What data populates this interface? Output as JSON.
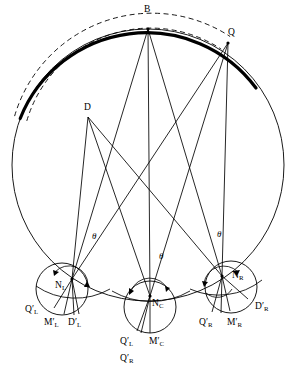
{
  "figure": {
    "title": "",
    "background": "#ffffff",
    "stroke_color": "#000000",
    "width": 292,
    "height": 375
  },
  "geometry": {
    "main_circle": {
      "cx": 148,
      "cy": 165,
      "r": 136
    },
    "bold_arc": {
      "cx": 148,
      "cy": 165,
      "r": 136,
      "start_deg": 200,
      "end_deg": 305
    },
    "dashed_arc_outer": {
      "cx": 148,
      "cy": 165,
      "r": 143,
      "start_deg": 200,
      "end_deg": 305
    },
    "dashed_arc_inner": {
      "cx": 148,
      "cy": 165,
      "r": 129,
      "start_deg": 200,
      "end_deg": 305
    },
    "node_circles": [
      {
        "name": "left",
        "cx": 62,
        "cy": 289,
        "r": 26
      },
      {
        "name": "center",
        "cx": 150,
        "cy": 307,
        "r": 26
      },
      {
        "name": "right",
        "cx": 231,
        "cy": 287,
        "r": 26
      }
    ],
    "node_points": [
      {
        "name": "N_L",
        "x": 72,
        "y": 279
      },
      {
        "name": "N_C",
        "x": 150,
        "y": 296
      },
      {
        "name": "N_R",
        "x": 222,
        "y": 276
      }
    ],
    "apex_points": [
      {
        "name": "B",
        "x": 148,
        "y": 29
      },
      {
        "name": "Q",
        "x": 228,
        "y": 43
      },
      {
        "name": "D",
        "x": 88,
        "y": 117
      }
    ]
  },
  "labels": {
    "apex": [
      {
        "id": "label-B",
        "text": "B",
        "sub": "",
        "prime": false,
        "x": 144,
        "y": 5
      },
      {
        "id": "label-Q",
        "text": "Q",
        "sub": "",
        "prime": false,
        "x": 228,
        "y": 28
      },
      {
        "id": "label-D",
        "text": "D",
        "sub": "",
        "prime": false,
        "x": 84,
        "y": 103
      }
    ],
    "nodes": [
      {
        "id": "label-NL",
        "text": "N",
        "sub": "L",
        "prime": false,
        "x": 55,
        "y": 281
      },
      {
        "id": "label-NC",
        "text": "N",
        "sub": "C",
        "prime": false,
        "x": 152,
        "y": 299
      },
      {
        "id": "label-NR",
        "text": "N",
        "sub": "R",
        "prime": false,
        "x": 232,
        "y": 271
      }
    ],
    "rays": [
      {
        "id": "label-QL-left",
        "text": "Q",
        "sub": "L",
        "prime": true,
        "x": 25,
        "y": 305
      },
      {
        "id": "label-ML-left",
        "text": "M",
        "sub": "L",
        "prime": true,
        "x": 44,
        "y": 318
      },
      {
        "id": "label-DL-left",
        "text": "D",
        "sub": "L",
        "prime": true,
        "x": 68,
        "y": 318
      },
      {
        "id": "label-QL-center",
        "text": "Q",
        "sub": "L",
        "prime": true,
        "x": 120,
        "y": 337
      },
      {
        "id": "label-MC-center",
        "text": "M",
        "sub": "C",
        "prime": true,
        "x": 149,
        "y": 337
      },
      {
        "id": "label-QR-center",
        "text": "Q",
        "sub": "R",
        "prime": true,
        "x": 120,
        "y": 354
      },
      {
        "id": "label-QR-right",
        "text": "Q",
        "sub": "R",
        "prime": true,
        "x": 199,
        "y": 318
      },
      {
        "id": "label-MR-right",
        "text": "M",
        "sub": "R",
        "prime": true,
        "x": 227,
        "y": 318
      },
      {
        "id": "label-DR-right",
        "text": "D",
        "sub": "R",
        "prime": true,
        "x": 255,
        "y": 302
      }
    ],
    "angles": [
      {
        "id": "theta-left",
        "text": "θ",
        "x": 92,
        "y": 232
      },
      {
        "id": "theta-center",
        "text": "θ",
        "x": 159,
        "y": 252
      },
      {
        "id": "theta-right",
        "text": "θ",
        "x": 217,
        "y": 230
      }
    ]
  },
  "lines": {
    "from_B": [
      {
        "to_x": 72,
        "to_y": 279
      },
      {
        "to_x": 150,
        "to_y": 296
      },
      {
        "to_x": 222,
        "to_y": 276
      }
    ],
    "from_Q": [
      {
        "to_x": 72,
        "to_y": 279
      },
      {
        "to_x": 150,
        "to_y": 296
      },
      {
        "to_x": 222,
        "to_y": 276
      }
    ],
    "from_D": [
      {
        "to_x": 72,
        "to_y": 279
      },
      {
        "to_x": 150,
        "to_y": 296
      },
      {
        "to_x": 222,
        "to_y": 276
      }
    ]
  }
}
